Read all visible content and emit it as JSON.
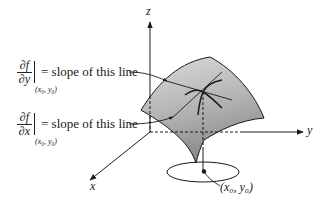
{
  "diagram": {
    "axes": {
      "z_label": "z",
      "y_label": "y",
      "x_label": "x"
    },
    "annotations": [
      {
        "numerator": "∂f",
        "denominator": "∂y",
        "evaluated_at": "(x₀, y₀)",
        "text": "= slope of this line"
      },
      {
        "numerator": "∂f",
        "denominator": "∂x",
        "evaluated_at": "(x₀, y₀)",
        "text": "= slope of this line"
      }
    ],
    "point_label": "(x₀, y₀)",
    "colors": {
      "surface_light": "#d9d9d9",
      "surface_dark": "#8f8f8f",
      "ink": "#1a1a1a"
    }
  }
}
